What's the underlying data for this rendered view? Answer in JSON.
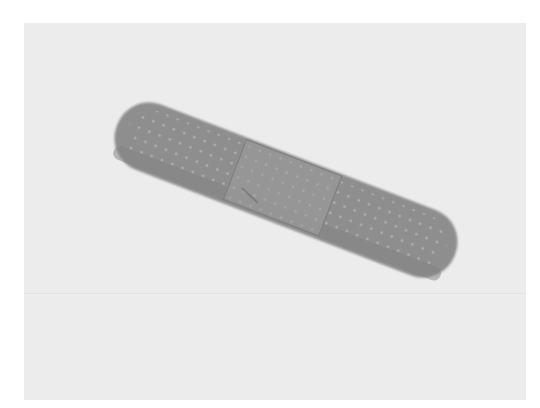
{
  "image": {
    "subject": "adhesive bandage",
    "description": "Grayscale photograph of a single adhesive bandage strip lying diagonally on a plain light background",
    "colors": {
      "page_background": "#ffffff",
      "photo_background": "#ececec",
      "bandage": "#8e8e8e",
      "bandage_shadow": "#7a7a7a",
      "pad": "#969696",
      "perforation": "#b4b4b4"
    },
    "bandage": {
      "center": [
        286,
        190
      ],
      "length": 362,
      "width": 70,
      "rotation_deg": 21,
      "pad_fraction": 0.28
    }
  }
}
